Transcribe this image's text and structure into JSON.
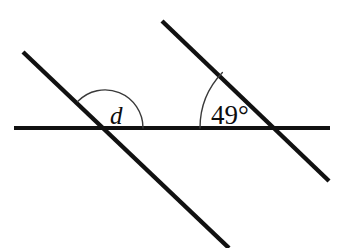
{
  "figure": {
    "type": "geometry-diagram",
    "background_color": "#ffffff",
    "stroke_color": "#111111",
    "width": 341,
    "height": 248
  },
  "lines": [
    {
      "id": "horizontal-line",
      "name": "horizontal-line",
      "x1": 14,
      "y1": 128,
      "x2": 330,
      "y2": 128,
      "stroke_width": 4.2,
      "color": "#111111"
    },
    {
      "id": "left-transversal",
      "name": "left-transversal-line",
      "x1": 23,
      "y1": 52,
      "x2": 229,
      "y2": 248,
      "stroke_width": 4.4,
      "color": "#111111"
    },
    {
      "id": "right-transversal",
      "name": "right-transversal-line",
      "x1": 162,
      "y1": 21,
      "x2": 329,
      "y2": 181,
      "stroke_width": 4.4,
      "color": "#111111"
    }
  ],
  "intersections": [
    {
      "id": "left-vertex",
      "x": 105,
      "y": 128
    },
    {
      "id": "right-vertex",
      "x": 280,
      "y": 128
    }
  ],
  "angles": [
    {
      "id": "angle-d",
      "label": "d",
      "label_style": "italic",
      "vertex_x": 105,
      "vertex_y": 128,
      "radius": 38,
      "start_angle_deg": 136,
      "end_angle_deg": 0,
      "arc_path": "M 77.6 101.6 A 38 38 0 0 1 143 128",
      "label_x": 110,
      "label_y": 124,
      "font_size": 25,
      "color": "#0d0d0d"
    },
    {
      "id": "angle-49",
      "label": "49°",
      "label_style": "upright",
      "vertex_x": 280,
      "vertex_y": 128,
      "radius": 80,
      "start_angle_deg": 180,
      "end_angle_deg": 136.2,
      "arc_path": "M 200 128 A 80 80 0 0 1 222.4 72.4",
      "label_x": 211,
      "label_y": 124,
      "font_size": 27,
      "color": "#0d0d0d"
    }
  ],
  "labels": {
    "unknown_angle": "d",
    "known_angle": "49°"
  }
}
